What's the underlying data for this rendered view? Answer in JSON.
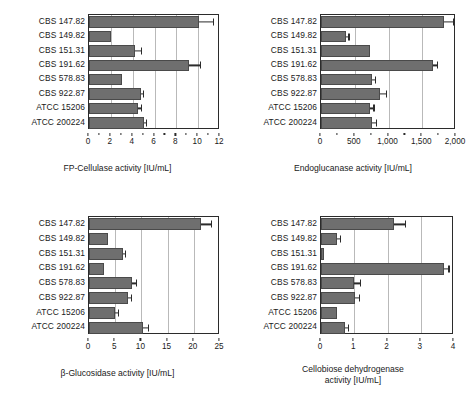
{
  "figure": {
    "categories": [
      "CBS 147.82",
      "CBS 149.82",
      "CBS 151.31",
      "CBS 191.62",
      "CBS 578.83",
      "CBS 922.87",
      "ATCC 15206",
      "ATCC 200224"
    ],
    "bar_color": "#6f6f6f",
    "axis_color": "#2b2b2b",
    "grid_color": "#b9b9b9"
  },
  "chart_data": [
    {
      "type": "bar",
      "orientation": "horizontal",
      "panel": "top-left",
      "title": "",
      "xlabel": "FP-Cellulase activity [IU/mL]",
      "ylabel": "",
      "xlim": [
        0,
        12
      ],
      "xticks": [
        0,
        2,
        4,
        6,
        8,
        10,
        12
      ],
      "xticklabels": [
        "0",
        "2",
        "4",
        "6",
        "8",
        "10",
        "12"
      ],
      "grid": true,
      "legend": null,
      "categories": [
        "CBS 147.82",
        "CBS 149.82",
        "CBS 151.31",
        "CBS 191.62",
        "CBS 578.83",
        "CBS 922.87",
        "ATCC 15206",
        "ATCC 200224"
      ],
      "values": [
        10.1,
        2.0,
        4.2,
        9.2,
        3.0,
        4.75,
        4.5,
        5.0
      ],
      "errors": [
        1.25,
        0.0,
        0.55,
        0.95,
        0.0,
        0.22,
        0.25,
        0.2
      ]
    },
    {
      "type": "bar",
      "orientation": "horizontal",
      "panel": "top-right",
      "title": "",
      "xlabel": "Endoglucanase activity [IU/mL]",
      "ylabel": "",
      "xlim": [
        0,
        2000
      ],
      "xticks": [
        0,
        500,
        1000,
        1500,
        2000
      ],
      "xticklabels": [
        "0",
        "500",
        "1,000",
        "1,500",
        "2,000"
      ],
      "grid": true,
      "legend": null,
      "categories": [
        "CBS 147.82",
        "CBS 149.82",
        "CBS 151.31",
        "CBS 191.62",
        "CBS 578.83",
        "CBS 922.87",
        "ATCC 15206",
        "ATCC 200224"
      ],
      "values": [
        1820,
        370,
        720,
        1660,
        760,
        880,
        730,
        760
      ],
      "errors": [
        130,
        35,
        0,
        60,
        35,
        85,
        45,
        55
      ]
    },
    {
      "type": "bar",
      "orientation": "horizontal",
      "panel": "bottom-left",
      "title": "",
      "xlabel": "β-Glucosidase activity [IU/mL]",
      "ylabel": "",
      "xlim": [
        0,
        25
      ],
      "xticks": [
        0,
        5,
        10,
        15,
        20,
        25
      ],
      "xticklabels": [
        "0",
        "5",
        "10",
        "15",
        "20",
        "25"
      ],
      "grid": true,
      "legend": null,
      "categories": [
        "CBS 147.82",
        "CBS 149.82",
        "CBS 151.31",
        "CBS 191.62",
        "CBS 578.83",
        "CBS 922.87",
        "ATCC 15206",
        "ATCC 200224"
      ],
      "values": [
        21.3,
        3.6,
        6.4,
        2.8,
        8.3,
        7.5,
        4.9,
        10.4
      ],
      "errors": [
        2.0,
        0.0,
        0.45,
        0.0,
        0.6,
        0.45,
        0.55,
        0.9
      ]
    },
    {
      "type": "bar",
      "orientation": "horizontal",
      "panel": "bottom-right",
      "title": "",
      "xlabel": "Cellobiose dehydrogenase activity [IU/mL]",
      "xlabel_line1": "Cellobiose dehydrogenase",
      "xlabel_line2": "activity [IU/mL]",
      "ylabel": "",
      "xlim": [
        0,
        4
      ],
      "xticks": [
        0,
        1,
        2,
        3,
        4
      ],
      "xticklabels": [
        "0",
        "1",
        "2",
        "3",
        "4"
      ],
      "grid": true,
      "legend": null,
      "categories": [
        "CBS 147.82",
        "CBS 149.82",
        "CBS 151.31",
        "CBS 191.62",
        "CBS 578.83",
        "CBS 922.87",
        "ATCC 15206",
        "ATCC 200224"
      ],
      "values": [
        2.2,
        0.47,
        0.08,
        3.7,
        0.98,
        1.02,
        0.47,
        0.72
      ],
      "errors": [
        0.33,
        0.09,
        0.0,
        0.13,
        0.2,
        0.13,
        0.0,
        0.09
      ]
    }
  ]
}
